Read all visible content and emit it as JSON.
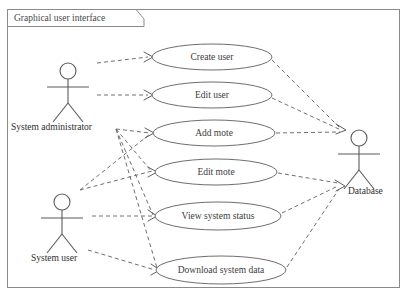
{
  "diagram": {
    "type": "uml-use-case-diagram",
    "frame": {
      "label": "Graphical user interface"
    },
    "actors": [
      {
        "id": "system-administrator",
        "label": "System administrator",
        "side": "left",
        "x": 68,
        "y": 85,
        "label_x": 11,
        "label_y": 128
      },
      {
        "id": "system-user",
        "label": "System user",
        "side": "left",
        "x": 62,
        "y": 216,
        "label_x": 31,
        "label_y": 259
      },
      {
        "id": "database",
        "label": "Database",
        "side": "right",
        "x": 359,
        "y": 152,
        "label_x": 348,
        "label_y": 192
      }
    ],
    "use_cases": [
      {
        "id": "create-user",
        "label": "Create user",
        "cx": 212,
        "cy": 57,
        "rx": 60,
        "ry": 13
      },
      {
        "id": "edit-user",
        "label": "Edit user",
        "cx": 212,
        "cy": 95,
        "rx": 60,
        "ry": 13
      },
      {
        "id": "add-mote",
        "label": "Add mote",
        "cx": 214,
        "cy": 133,
        "rx": 61,
        "ry": 13
      },
      {
        "id": "edit-mote",
        "label": "Edit mote",
        "cx": 216,
        "cy": 172,
        "rx": 61,
        "ry": 13
      },
      {
        "id": "view-system-status",
        "label": "View system status",
        "cx": 218,
        "cy": 216,
        "rx": 63,
        "ry": 14
      },
      {
        "id": "download-system-data",
        "label": "Download system data",
        "cx": 221,
        "cy": 270,
        "rx": 65,
        "ry": 14
      }
    ],
    "associations": [
      {
        "from": "system-administrator",
        "to": "create-user"
      },
      {
        "from": "system-administrator",
        "to": "edit-user"
      },
      {
        "from": "system-administrator",
        "to": "add-mote"
      },
      {
        "from": "system-administrator",
        "to": "edit-mote"
      },
      {
        "from": "system-administrator",
        "to": "view-system-status"
      },
      {
        "from": "system-administrator",
        "to": "download-system-data"
      },
      {
        "from": "system-user",
        "to": "view-system-status"
      },
      {
        "from": "system-user",
        "to": "download-system-data"
      },
      {
        "from": "create-user",
        "to": "database"
      },
      {
        "from": "edit-user",
        "to": "database"
      },
      {
        "from": "add-mote",
        "to": "database"
      },
      {
        "from": "edit-mote",
        "to": "database"
      },
      {
        "from": "view-system-status",
        "to": "database"
      },
      {
        "from": "download-system-data",
        "to": "database"
      }
    ],
    "colors": {
      "background": "#ffffff",
      "frame_stroke": "#8a8a8a",
      "ellipse_stroke": "#6e6e6e",
      "actor_stroke": "#5a5a5a",
      "line_stroke": "#707070",
      "text": "#2e2e2e"
    }
  }
}
